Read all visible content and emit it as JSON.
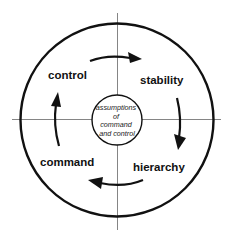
{
  "diagram": {
    "center_text": {
      "lines": [
        "assumptions",
        "of",
        "command",
        "and control"
      ]
    },
    "quadrants": {
      "top_left": "control",
      "top_right": "stability",
      "bottom_right": "hierarchy",
      "bottom_left": "command"
    },
    "cycle_direction": "clockwise",
    "arrows": [
      {
        "from": "control",
        "to": "stability",
        "position": "top"
      },
      {
        "from": "stability",
        "to": "hierarchy",
        "position": "right"
      },
      {
        "from": "hierarchy",
        "to": "command",
        "position": "bottom"
      },
      {
        "from": "command",
        "to": "control",
        "position": "left"
      }
    ],
    "colors": {
      "stroke": "#111111",
      "axis": "#555555",
      "background": "#ffffff"
    }
  }
}
